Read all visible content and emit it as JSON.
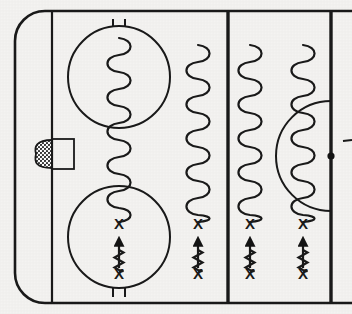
{
  "diagram": {
    "sport": "ice-hockey",
    "view": "half-rink-defensive-zone",
    "background_color": "#f4f3f1",
    "ink_color": "#1a1a1a"
  },
  "rink": {
    "boards": {
      "label": "Rink boards outline",
      "x": 15,
      "y": 10,
      "width": 337,
      "height": 294,
      "corner_radius": 30,
      "stroke_width": 2.6
    },
    "goal_line": {
      "label": "Goal line",
      "x": 52,
      "y1": 11,
      "y2": 303,
      "stroke_width": 2.2
    },
    "blue_line": {
      "label": "Blue line",
      "x": 228,
      "y1": 11,
      "y2": 303,
      "stroke_width": 3.4
    },
    "center_line": {
      "label": "Center red line",
      "x": 331,
      "y1": 11,
      "y2": 303,
      "stroke_width": 3.4
    },
    "center_dot": {
      "label": "Center face-off dot",
      "cx": 331,
      "cy": 156,
      "r": 3.6
    },
    "center_circle": {
      "label": "Center face-off circle",
      "cx": 331,
      "cy": 156,
      "r": 55
    },
    "edge_tick": {
      "label": "Boards reference tick",
      "x1": 344,
      "x2": 352,
      "y": 141
    },
    "goal_net": {
      "label": "Goal net",
      "x": 52,
      "y": 139,
      "width": 22,
      "height": 30
    },
    "goal_crease": {
      "label": "Shaded goal crease",
      "cx": 47,
      "cy": 154,
      "rx": 11,
      "ry": 15
    }
  },
  "faceoff_circles": [
    {
      "name": "top-faceoff-circle",
      "label": "Top face-off circle",
      "cx": 119,
      "cy": 77,
      "r": 51,
      "hash_marks": "top"
    },
    {
      "name": "bottom-faceoff-circle",
      "label": "Bottom face-off circle",
      "cx": 119,
      "cy": 237,
      "r": 51,
      "hash_marks": "bottom"
    }
  ],
  "drill_lanes": [
    {
      "name": "lane-1",
      "label": "Lane 1 — goal-line lane",
      "x": 119,
      "weave": {
        "y_top": 38,
        "y_bottom": 222,
        "amplitude": 7,
        "period": 17
      },
      "x_top": {
        "y": 229,
        "label": "X"
      },
      "forward_arrow": {
        "y_start": 268,
        "y_end": 239
      },
      "backward_skate": {
        "y_top": 250,
        "y_bottom": 272,
        "amplitude": 4.5,
        "period": 10
      },
      "x_bottom": {
        "y": 279,
        "label": "X"
      }
    },
    {
      "name": "lane-2",
      "label": "Lane 2",
      "x": 198,
      "weave": {
        "y_top": 45,
        "y_bottom": 222,
        "amplitude": 7,
        "period": 17
      },
      "x_top": {
        "y": 229,
        "label": "X"
      },
      "forward_arrow": {
        "y_start": 268,
        "y_end": 239
      },
      "backward_skate": {
        "y_top": 250,
        "y_bottom": 272,
        "amplitude": 4.5,
        "period": 10
      },
      "x_bottom": {
        "y": 279,
        "label": "X"
      }
    },
    {
      "name": "lane-3",
      "label": "Lane 3",
      "x": 250,
      "weave": {
        "y_top": 45,
        "y_bottom": 222,
        "amplitude": 7,
        "period": 17
      },
      "x_top": {
        "y": 229,
        "label": "X"
      },
      "forward_arrow": {
        "y_start": 268,
        "y_end": 239
      },
      "backward_skate": {
        "y_top": 250,
        "y_bottom": 272,
        "amplitude": 4.5,
        "period": 10
      },
      "x_bottom": {
        "y": 279,
        "label": "X"
      }
    },
    {
      "name": "lane-4",
      "label": "Lane 4 — center-circle lane",
      "x": 303,
      "weave": {
        "y_top": 45,
        "y_bottom": 222,
        "amplitude": 7,
        "period": 17
      },
      "x_top": {
        "y": 229,
        "label": "X"
      },
      "forward_arrow": {
        "y_start": 268,
        "y_end": 239
      },
      "backward_skate": {
        "y_top": 250,
        "y_bottom": 272,
        "amplitude": 4.5,
        "period": 10
      },
      "x_bottom": {
        "y": 279,
        "label": "X"
      }
    }
  ],
  "legend_symbols": {
    "player_marker": "X",
    "weave_label": "weaving / serpentine skating",
    "arrow_label": "forward skate with puck",
    "zigzag_label": "backward skating"
  }
}
